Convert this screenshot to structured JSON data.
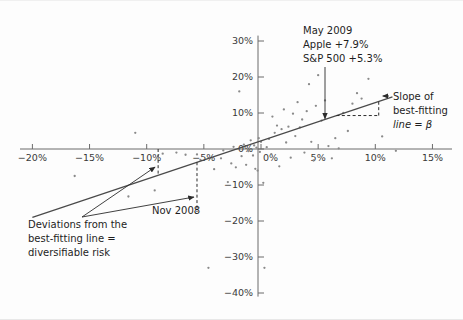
{
  "chart_data": {
    "type": "scatter",
    "title": "",
    "xlabel": "",
    "ylabel": "",
    "xlim": [
      -20,
      15
    ],
    "ylim": [
      -40,
      30
    ],
    "grid": false,
    "legend": null,
    "x_ticklabels": [
      "−20%",
      "−15%",
      "−10%",
      "−5%",
      "0%",
      "5%",
      "10%",
      "15%"
    ],
    "x_tickvalues": [
      -20,
      -15,
      -10,
      -5,
      0,
      5,
      10,
      15
    ],
    "y_ticklabels": [
      "30%",
      "20%",
      "10%",
      "0%",
      "−10%",
      "−20%",
      "−30%",
      "−40%"
    ],
    "y_tickvalues": [
      30,
      20,
      10,
      0,
      -10,
      -20,
      -30,
      -40
    ],
    "series": [
      {
        "name": "Apple monthly return vs S&P 500 monthly return",
        "points": [
          [
            -16.3,
            -7.5
          ],
          [
            -11.6,
            -13.2
          ],
          [
            -11.0,
            4.5
          ],
          [
            -9.3,
            -11.5
          ],
          [
            -8.6,
            -1.3
          ],
          [
            -7.4,
            -1.0
          ],
          [
            -6.6,
            -1.6
          ],
          [
            -5.6,
            -1.5
          ],
          [
            -5.3,
            -3.0
          ],
          [
            -4.6,
            -33.0
          ],
          [
            -4.1,
            -5.6
          ],
          [
            -3.5,
            -2.6
          ],
          [
            -3.3,
            -0.4
          ],
          [
            -2.9,
            -9.2
          ],
          [
            -2.6,
            -4.0
          ],
          [
            -2.4,
            0.6
          ],
          [
            -2.2,
            -5.1
          ],
          [
            -1.9,
            16.0
          ],
          [
            -1.7,
            -2.0
          ],
          [
            -1.5,
            1.2
          ],
          [
            -1.3,
            -4.4
          ],
          [
            -1.1,
            -0.6
          ],
          [
            -0.9,
            2.4
          ],
          [
            -0.7,
            -1.8
          ],
          [
            -0.6,
            1.0
          ],
          [
            -0.5,
            -5.5
          ],
          [
            -0.4,
            0.4
          ],
          [
            -0.3,
            -6.0
          ],
          [
            -0.2,
            3.0
          ],
          [
            -0.1,
            -0.8
          ],
          [
            0.0,
            2.0
          ],
          [
            0.2,
            -9.4
          ],
          [
            0.3,
            -33.0
          ],
          [
            0.5,
            0.5
          ],
          [
            0.7,
            2.8
          ],
          [
            0.9,
            -1.4
          ],
          [
            1.0,
            9.0
          ],
          [
            1.2,
            4.5
          ],
          [
            1.4,
            6.5
          ],
          [
            1.6,
            -4.8
          ],
          [
            1.8,
            5.5
          ],
          [
            2.0,
            11.0
          ],
          [
            2.2,
            1.8
          ],
          [
            2.4,
            6.2
          ],
          [
            2.6,
            -2.4
          ],
          [
            2.8,
            9.8
          ],
          [
            3.0,
            3.6
          ],
          [
            3.2,
            13.0
          ],
          [
            3.4,
            6.0
          ],
          [
            3.6,
            8.2
          ],
          [
            3.8,
            -1.0
          ],
          [
            4.0,
            10.5
          ],
          [
            4.2,
            18.0
          ],
          [
            4.4,
            2.0
          ],
          [
            4.6,
            -3.2
          ],
          [
            4.8,
            12.0
          ],
          [
            5.0,
            20.5
          ],
          [
            5.3,
            7.9
          ],
          [
            5.6,
            13.5
          ],
          [
            5.9,
            0.8
          ],
          [
            6.2,
            -2.6
          ],
          [
            6.5,
            3.0
          ],
          [
            6.8,
            0.2
          ],
          [
            7.2,
            10.0
          ],
          [
            7.6,
            5.0
          ],
          [
            8.0,
            12.6
          ],
          [
            8.4,
            15.5
          ],
          [
            8.8,
            14.0
          ],
          [
            9.4,
            19.5
          ],
          [
            10.6,
            3.5
          ],
          [
            11.8,
            -0.5
          ]
        ]
      }
    ],
    "fit_line": {
      "name": "best-fitting line",
      "x_start": -20.0,
      "y_start": -19.0,
      "x_end": 11.5,
      "y_end": 14.5,
      "beta_symbol": "β"
    },
    "annotations": [
      {
        "id": "may-2009",
        "lines": [
          "May 2009",
          "Apple +7.9%",
          "S&P 500 +5.3%"
        ],
        "point": [
          5.3,
          7.9
        ]
      },
      {
        "id": "slope-beta",
        "lines": [
          "Slope of",
          "best-fitting",
          "line = β"
        ]
      },
      {
        "id": "deviations",
        "lines": [
          "Deviations from the",
          "best-fitting line =",
          "diversifiable risk"
        ]
      },
      {
        "id": "nov-2008",
        "lines": [
          "Nov 2008"
        ],
        "point": [
          -7.4,
          -16.8
        ]
      }
    ]
  },
  "colors": {
    "background": "#fdfdfd",
    "axis": "#6b6b6b",
    "point": "#8a8a8a",
    "fit_line": "#4a4a4a",
    "text": "#1e1e1e"
  },
  "labels": {
    "may2009_l1": "May 2009",
    "may2009_l2": "Apple +7.9%",
    "may2009_l3": "S&P 500 +5.3%",
    "slope_l1": "Slope of",
    "slope_l2": "best-fitting",
    "slope_l3": "line = β",
    "dev_l1": "Deviations from the",
    "dev_l2": "best-fitting line =",
    "dev_l3": "diversifiable risk",
    "nov2008": "Nov 2008"
  }
}
